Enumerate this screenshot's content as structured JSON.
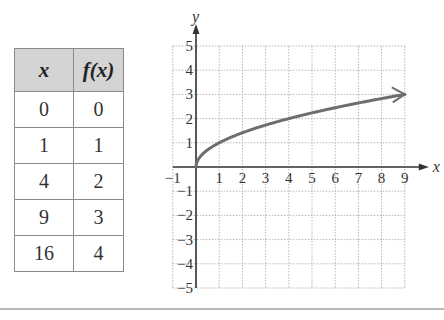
{
  "table": {
    "headers": [
      "x",
      "f(x)"
    ],
    "rows": [
      [
        "0",
        "0"
      ],
      [
        "1",
        "1"
      ],
      [
        "4",
        "2"
      ],
      [
        "9",
        "3"
      ],
      [
        "16",
        "4"
      ]
    ]
  },
  "chart_data": {
    "type": "line",
    "function": "f(x) = sqrt(x)",
    "title": "",
    "xlabel": "x",
    "ylabel": "y",
    "xlim": [
      -1,
      9
    ],
    "ylim": [
      -5,
      5
    ],
    "grid": true,
    "x_ticks": [
      "-1",
      "1",
      "2",
      "3",
      "4",
      "5",
      "6",
      "7",
      "8",
      "9"
    ],
    "y_ticks": [
      "5",
      "4",
      "3",
      "2",
      "1",
      "-1",
      "-2",
      "-3",
      "-4",
      "-5"
    ],
    "series": [
      {
        "name": "f(x)",
        "x": [
          0,
          1,
          4,
          9
        ],
        "y": [
          0,
          1,
          2,
          3
        ],
        "color": "#6e6e6e",
        "end_arrow": true
      }
    ],
    "table_points": [
      {
        "x": 0,
        "y": 0
      },
      {
        "x": 1,
        "y": 1
      },
      {
        "x": 4,
        "y": 2
      },
      {
        "x": 9,
        "y": 3
      },
      {
        "x": 16,
        "y": 4
      }
    ]
  },
  "colors": {
    "curve": "#6e6e6e",
    "axis": "#333333",
    "grid": "#b5b5b5",
    "header_bg": "#d4d4d4",
    "rule": "#b8b8b8"
  }
}
